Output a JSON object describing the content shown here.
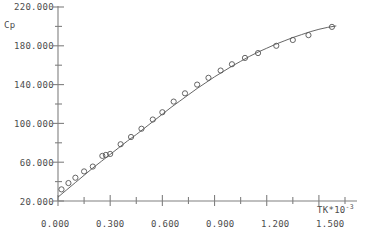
{
  "chart_data": {
    "type": "scatter",
    "title": "",
    "xlabel": "TK*10-3",
    "xlabel_base": "TK*10",
    "xlabel_exponent": "-3",
    "ylabel": "Cp",
    "xlim": [
      0.0,
      1.65
    ],
    "ylim": [
      20.0,
      220.0
    ],
    "grid": false,
    "legend": null,
    "x_ticks": [
      0.0,
      0.3,
      0.6,
      0.9,
      1.2,
      1.5
    ],
    "x_tick_labels": [
      "0.000",
      "0.300",
      "0.600",
      "0.900",
      "1.200",
      "1.500"
    ],
    "x_minor_ticks": [
      0.15,
      0.45,
      0.75,
      1.05,
      1.35,
      1.65
    ],
    "y_ticks": [
      20.0,
      60.0,
      100.0,
      140.0,
      180.0,
      220.0
    ],
    "y_tick_labels": [
      "20.000",
      "60.000",
      "100.000",
      "140.000",
      "180.000",
      "220.000"
    ],
    "y_minor_ticks": [
      40.0,
      80.0,
      120.0,
      160.0,
      200.0
    ],
    "marker": "open-circle",
    "marker_color": "#555555",
    "line_color": "#555555",
    "axis_color": "#808080",
    "series": [
      {
        "name": "Cp data",
        "x": [
          0.02,
          0.06,
          0.1,
          0.15,
          0.2,
          0.255,
          0.275,
          0.3,
          0.36,
          0.42,
          0.48,
          0.545,
          0.6,
          0.665,
          0.73,
          0.8,
          0.865,
          0.935,
          1.0,
          1.075,
          1.15,
          1.255,
          1.35,
          1.44,
          1.575
        ],
        "y": [
          32.0,
          38.5,
          44.0,
          50.5,
          55.5,
          66.5,
          67.5,
          68.5,
          78.5,
          86.0,
          94.5,
          104.0,
          111.5,
          122.5,
          131.0,
          140.0,
          147.0,
          154.5,
          161.0,
          167.5,
          172.5,
          180.0,
          186.0,
          191.0,
          199.5
        ]
      }
    ],
    "curve": {
      "name": "fitted curve",
      "x": [
        0.0,
        0.05,
        0.1,
        0.15,
        0.2,
        0.25,
        0.3,
        0.35,
        0.4,
        0.45,
        0.5,
        0.55,
        0.6,
        0.65,
        0.7,
        0.75,
        0.8,
        0.85,
        0.9,
        0.95,
        1.0,
        1.05,
        1.1,
        1.15,
        1.2,
        1.25,
        1.3,
        1.35,
        1.4,
        1.45,
        1.5,
        1.55,
        1.6
      ],
      "y": [
        24.0,
        31.5,
        39.0,
        46.5,
        54.0,
        61.0,
        68.0,
        75.0,
        82.0,
        88.5,
        95.5,
        102.5,
        109.5,
        116.5,
        123.0,
        129.5,
        136.0,
        142.0,
        148.0,
        153.5,
        159.0,
        164.0,
        169.0,
        173.5,
        177.5,
        181.5,
        185.0,
        188.5,
        191.5,
        194.5,
        197.0,
        199.0,
        200.5
      ]
    }
  },
  "axis_labels": {
    "y": {
      "t220": "220.000",
      "t180": "180.000",
      "t140": "140.000",
      "t100": "100.000",
      "t60": "60.000",
      "t20": "20.000",
      "name": "Cp"
    },
    "x": {
      "t0": "0.000",
      "t300": "0.300",
      "t600": "0.600",
      "t900": "0.900",
      "t1200": "1.200",
      "t1500": "1.500",
      "name_base": "TK*10",
      "name_exp": "-3"
    }
  }
}
